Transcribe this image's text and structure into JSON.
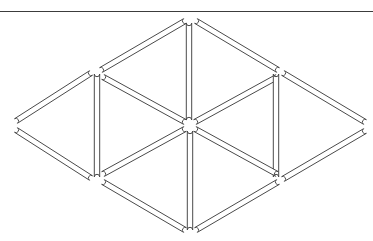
{
  "page": {
    "background_color": "#ffffff",
    "width": 373,
    "height": 241
  },
  "figure": {
    "name": "six-triangle-matchstick-arrangement",
    "triangle_count": 6,
    "matchstick_count": 12,
    "stick_style": {
      "fill_color": "#ffffff",
      "stroke_color": "#4a4a4a",
      "stroke_width": 1,
      "thickness": 5.4,
      "cap": "round"
    },
    "vertices": {
      "top_apex": [
        190,
        18
      ],
      "bottom_apex": [
        190,
        233
      ],
      "left_vertex": [
        14,
        125
      ],
      "right_vertex": [
        367,
        126
      ],
      "upper_left_node": [
        100,
        72
      ],
      "upper_right_node": [
        279,
        72
      ],
      "lower_left_node": [
        100,
        179
      ],
      "lower_right_node": [
        279,
        179
      ],
      "center_node": [
        190,
        125
      ]
    },
    "sticks": [
      {
        "id": "s1",
        "name": "upper-left-diagonal-top",
        "x1": 101,
        "y1": 70,
        "x2": 185,
        "y2": 21
      },
      {
        "id": "s2",
        "name": "upper-right-diagonal-top",
        "x1": 196,
        "y1": 21,
        "x2": 278,
        "y2": 70
      },
      {
        "id": "s3",
        "name": "center-upper-vertical",
        "x1": 189,
        "y1": 23,
        "x2": 189,
        "y2": 120
      },
      {
        "id": "s4",
        "name": "upper-left-inner-diagonal",
        "x1": 103,
        "y1": 77,
        "x2": 185,
        "y2": 122
      },
      {
        "id": "s5",
        "name": "upper-right-inner-diagonal",
        "x1": 195,
        "y1": 122,
        "x2": 277,
        "y2": 77
      },
      {
        "id": "s6",
        "name": "left-vertical",
        "x1": 97,
        "y1": 74,
        "x2": 97,
        "y2": 177
      },
      {
        "id": "s7",
        "name": "right-vertical",
        "x1": 276,
        "y1": 74,
        "x2": 276,
        "y2": 177
      },
      {
        "id": "s8",
        "name": "left-triangle-upper-edge",
        "x1": 91,
        "y1": 73,
        "x2": 16,
        "y2": 121
      },
      {
        "id": "s9",
        "name": "left-triangle-lower-edge",
        "x1": 16,
        "y1": 130,
        "x2": 91,
        "y2": 178
      },
      {
        "id": "s10",
        "name": "right-triangle-upper-edge",
        "x1": 283,
        "y1": 73,
        "x2": 365,
        "y2": 122
      },
      {
        "id": "s11",
        "name": "right-triangle-lower-edge",
        "x1": 365,
        "y1": 131,
        "x2": 283,
        "y2": 179
      },
      {
        "id": "s12",
        "name": "lower-left-inner-diagonal",
        "x1": 103,
        "y1": 174,
        "x2": 185,
        "y2": 129
      },
      {
        "id": "s13",
        "name": "lower-right-inner-diagonal",
        "x1": 195,
        "y1": 129,
        "x2": 277,
        "y2": 174
      },
      {
        "id": "s14",
        "name": "center-lower-vertical",
        "x1": 190,
        "y1": 131,
        "x2": 190,
        "y2": 230
      },
      {
        "id": "s15",
        "name": "lower-left-diagonal-bottom",
        "x1": 103,
        "y1": 182,
        "x2": 185,
        "y2": 230
      },
      {
        "id": "s16",
        "name": "lower-right-diagonal-bottom",
        "x1": 196,
        "y1": 230,
        "x2": 278,
        "y2": 182
      }
    ],
    "triangles": [
      {
        "name": "top-left-triangle",
        "orientation": "apex-up"
      },
      {
        "name": "top-right-triangle",
        "orientation": "apex-up"
      },
      {
        "name": "left-triangle",
        "orientation": "apex-left"
      },
      {
        "name": "right-triangle",
        "orientation": "apex-right"
      },
      {
        "name": "bottom-left-triangle",
        "orientation": "apex-down"
      },
      {
        "name": "bottom-right-triangle",
        "orientation": "apex-down"
      }
    ]
  },
  "top_rule": {
    "name": "top-horizontal-rule",
    "color": "#3c3c3c",
    "y": 11,
    "x1": 0,
    "x2": 373,
    "thickness": 1
  }
}
